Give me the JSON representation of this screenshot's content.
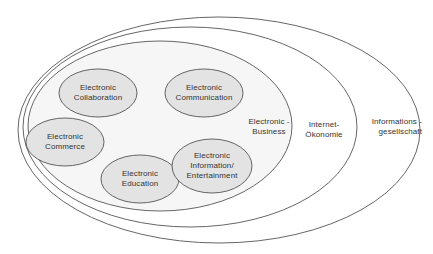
{
  "diagram": {
    "rings": [
      {
        "id": "informationsgesellschaft",
        "lines": [
          "Informations -",
          "gesellschaft"
        ]
      },
      {
        "id": "internet-oekonomie",
        "lines": [
          "Internet-",
          "Ökonomie"
        ]
      },
      {
        "id": "electronic-business",
        "lines": [
          "Electronic -",
          "Business"
        ]
      }
    ],
    "nodes": [
      {
        "id": "collaboration",
        "lines": [
          "Electronic",
          "Collaboration"
        ]
      },
      {
        "id": "communication",
        "lines": [
          "Electronic",
          "Communication"
        ]
      },
      {
        "id": "commerce",
        "lines": [
          "Electronic",
          "Commerce"
        ]
      },
      {
        "id": "education",
        "lines": [
          "Electronic",
          "Education"
        ]
      },
      {
        "id": "information-entertainment",
        "lines": [
          "Electronic",
          "Information/",
          "Entertainment"
        ]
      }
    ],
    "colors": {
      "background": "#ffffff",
      "stroke": "#555555",
      "node_fill": "#e3e3e3",
      "business_fill": "#f6f6f6",
      "text": "#333333"
    }
  }
}
